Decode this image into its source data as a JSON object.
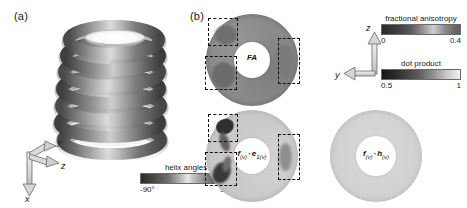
{
  "figure": {
    "width": 467,
    "height": 208,
    "background": "#ffffff"
  },
  "panels": {
    "a": {
      "label": "(a)",
      "content_name": "helix-volume-rendering",
      "turns": 7,
      "axes": {
        "x": "x",
        "y": "y",
        "z": "z"
      },
      "colorbar": {
        "title": "helix angles",
        "min_label": "-90°",
        "max_label": "90°",
        "gradient": [
          "#2b2b2b",
          "#6e6e6e",
          "#e8e8e8",
          "#7a7a7a",
          "#2e2e2e"
        ]
      }
    },
    "b": {
      "label": "(b)",
      "axes": {
        "y": "y",
        "z": "z"
      },
      "maps": [
        {
          "name": "fa-map",
          "label_plain": "FA",
          "label_html": "FA",
          "fill": "#8b8b8b",
          "roi_count": 3
        },
        {
          "name": "f-dot-e1-map",
          "label_plain": "f(v) · e1(v)",
          "label_html": "f<sub>(v)</sub><span class=\"dotop\">·</span>e<sub>1(v)</sub>",
          "fill": "#c9c9c9",
          "roi_count": 3
        },
        {
          "name": "f-dot-h-map",
          "label_plain": "f(v) · h(v)",
          "label_html": "f<sub>(v)</sub><span class=\"dotop\">·</span>h<sub>(v)</sub>",
          "fill": "#d2d2d2",
          "roi_count": 0
        }
      ],
      "colorbars": [
        {
          "name": "fractional-anisotropy-colorbar",
          "title": "fractional anisotropy",
          "min_label": "0",
          "max_label": "0.4",
          "gradient": [
            "#2a2a2a",
            "#5c5c5c",
            "#cfcfcf",
            "#6a6a6a"
          ]
        },
        {
          "name": "dot-product-colorbar",
          "title": "dot product",
          "min_label": "0.5",
          "max_label": "1",
          "gradient": [
            "#151515",
            "#585858",
            "#c6c6c6",
            "#f2f2f2"
          ]
        }
      ]
    }
  },
  "chart_data": {
    "type": "heatmap",
    "title": "",
    "subtitle": "",
    "xlabel": "",
    "ylabel": "",
    "grid": false,
    "legend_position": "right",
    "panels": [
      {
        "panel": "(a)",
        "type": "volume-rendering",
        "description": "3D helical coil phantom colored by helix angle",
        "turns": 7,
        "scalar": "helix angles",
        "scalar_range": [
          -90,
          90
        ],
        "scalar_units": "degrees",
        "axes_shown": [
          "x",
          "y",
          "z"
        ]
      },
      {
        "panel": "(b)",
        "type": "cross-section-maps",
        "axes_shown": [
          "y",
          "z"
        ],
        "maps": [
          {
            "label": "FA",
            "scalar": "fractional anisotropy",
            "scalar_range": [
              0,
              0.4
            ],
            "mean_value": 0.22,
            "roi_count": 3,
            "geometry": "annulus"
          },
          {
            "label": "f(v) · e1(v)",
            "scalar": "dot product",
            "scalar_range": [
              0.5,
              1
            ],
            "mean_value": 0.92,
            "roi_count": 3,
            "geometry": "annulus"
          },
          {
            "label": "f(v) · h(v)",
            "scalar": "dot product",
            "scalar_range": [
              0.5,
              1
            ],
            "mean_value": 0.97,
            "roi_count": 0,
            "geometry": "annulus"
          }
        ],
        "colorbars": [
          {
            "title": "fractional anisotropy",
            "ticks": [
              0,
              0.4
            ]
          },
          {
            "title": "dot product",
            "ticks": [
              0.5,
              1
            ]
          }
        ]
      }
    ]
  }
}
